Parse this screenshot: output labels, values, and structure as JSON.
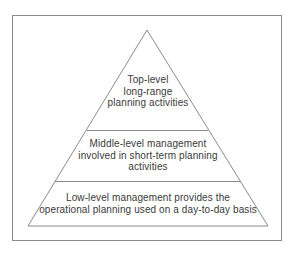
{
  "diagram": {
    "type": "pyramid",
    "levels": [
      {
        "id": "top",
        "lines": [
          "Top-level",
          "long-range",
          "planning activities"
        ]
      },
      {
        "id": "middle",
        "lines": [
          "Middle-level management",
          "involved in short-term planning",
          "activities"
        ]
      },
      {
        "id": "low",
        "lines": [
          "Low-level management provides the",
          "operational planning used on a day-to-day basis"
        ]
      }
    ],
    "colors": {
      "stroke": "#8a8a8a",
      "text": "#3a3a3a",
      "background": "#ffffff"
    }
  }
}
